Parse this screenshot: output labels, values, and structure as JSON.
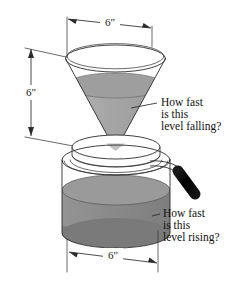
{
  "figure": {
    "background_color": "#ffffff",
    "dimensions": {
      "cone_diameter_label": "6\"",
      "cone_height_label": "6\"",
      "pot_diameter_label": "6\""
    },
    "callouts": {
      "upper": {
        "line1": "How fast",
        "line2": "is this",
        "line3": "level falling?"
      },
      "lower": {
        "line1": "How fast",
        "line2": "is this",
        "line3": "level rising?"
      }
    },
    "colors": {
      "outline": "#2b2b2b",
      "cone_liquid": "#a9a9a9",
      "cone_liquid_top": "#9e9e9e",
      "pot_liquid": "#8c8c8c",
      "pot_liquid_top": "#9a9a9a",
      "pot_liquid_shadow": "#6f6f6f",
      "lid_fill": "#fefefe",
      "handle_grip": "#0d0d0d",
      "text": "#111111"
    },
    "parts": {
      "funnel": "inverted-cone-funnel",
      "pot": "cylindrical-coffee-pot",
      "lid": "pot-lid",
      "handle": "pot-handle",
      "cone_liquid_surface": "falling-level",
      "pot_liquid_surface": "rising-level"
    }
  }
}
